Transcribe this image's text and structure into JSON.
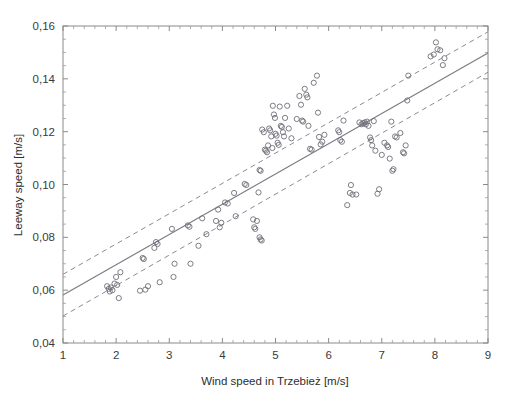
{
  "chart_data": {
    "type": "scatter",
    "title": "",
    "xlabel": "Wind speed in Trzebież [m/s]",
    "ylabel": "Leeway speed [m/s]",
    "xlim": [
      1,
      9
    ],
    "ylim": [
      0.04,
      0.16
    ],
    "xticks": [
      1,
      2,
      3,
      4,
      5,
      6,
      7,
      8,
      9
    ],
    "yticks": [
      0.04,
      0.06,
      0.08,
      0.1,
      0.12,
      0.14,
      0.16
    ],
    "xtick_labels": [
      "1",
      "2",
      "3",
      "4",
      "5",
      "6",
      "7",
      "8",
      "9"
    ],
    "ytick_labels": [
      "0,04",
      "0,06",
      "0,08",
      "0,10",
      "0,12",
      "0,14",
      "0,16"
    ],
    "x_minor_step": 0.2,
    "y_minor_step": 0.005,
    "grid": false,
    "legend": null,
    "marker": "open-circle",
    "marker_color": "#6e6e78",
    "series": [
      {
        "name": "Measurements",
        "points": [
          [
            1.83,
            0.0615
          ],
          [
            1.86,
            0.0605
          ],
          [
            1.88,
            0.0595
          ],
          [
            1.9,
            0.061
          ],
          [
            1.93,
            0.06
          ],
          [
            1.97,
            0.0625
          ],
          [
            2.0,
            0.065
          ],
          [
            2.02,
            0.062
          ],
          [
            2.05,
            0.057
          ],
          [
            2.08,
            0.0668
          ],
          [
            2.45,
            0.0598
          ],
          [
            2.5,
            0.0722
          ],
          [
            2.52,
            0.0718
          ],
          [
            2.55,
            0.0602
          ],
          [
            2.6,
            0.0615
          ],
          [
            2.72,
            0.076
          ],
          [
            2.75,
            0.0782
          ],
          [
            2.78,
            0.0775
          ],
          [
            2.82,
            0.063
          ],
          [
            3.05,
            0.0832
          ],
          [
            3.08,
            0.065
          ],
          [
            3.1,
            0.07
          ],
          [
            3.35,
            0.0845
          ],
          [
            3.38,
            0.084
          ],
          [
            3.4,
            0.07
          ],
          [
            3.55,
            0.0768
          ],
          [
            3.62,
            0.0872
          ],
          [
            3.7,
            0.0812
          ],
          [
            3.88,
            0.0862
          ],
          [
            3.92,
            0.0905
          ],
          [
            3.95,
            0.0838
          ],
          [
            3.98,
            0.0855
          ],
          [
            4.05,
            0.0932
          ],
          [
            4.1,
            0.0928
          ],
          [
            4.22,
            0.0968
          ],
          [
            4.25,
            0.088
          ],
          [
            4.42,
            0.1002
          ],
          [
            4.45,
            0.0998
          ],
          [
            4.58,
            0.0868
          ],
          [
            4.6,
            0.0838
          ],
          [
            4.62,
            0.0832
          ],
          [
            4.65,
            0.0862
          ],
          [
            4.68,
            0.097
          ],
          [
            4.7,
            0.08
          ],
          [
            4.72,
            0.0792
          ],
          [
            4.74,
            0.0788
          ],
          [
            4.7,
            0.1055
          ],
          [
            4.72,
            0.1052
          ],
          [
            4.75,
            0.1208
          ],
          [
            4.78,
            0.1198
          ],
          [
            4.8,
            0.1132
          ],
          [
            4.82,
            0.1128
          ],
          [
            4.84,
            0.1122
          ],
          [
            4.86,
            0.1148
          ],
          [
            4.88,
            0.1212
          ],
          [
            4.9,
            0.1205
          ],
          [
            4.92,
            0.1182
          ],
          [
            4.94,
            0.1138
          ],
          [
            4.95,
            0.1298
          ],
          [
            4.97,
            0.1265
          ],
          [
            4.99,
            0.1252
          ],
          [
            5.0,
            0.1192
          ],
          [
            5.02,
            0.1185
          ],
          [
            5.04,
            0.1158
          ],
          [
            5.06,
            0.115
          ],
          [
            5.08,
            0.1295
          ],
          [
            5.1,
            0.1222
          ],
          [
            5.12,
            0.1218
          ],
          [
            5.14,
            0.1198
          ],
          [
            5.16,
            0.1182
          ],
          [
            5.18,
            0.1252
          ],
          [
            5.22,
            0.1298
          ],
          [
            5.25,
            0.1212
          ],
          [
            5.3,
            0.1175
          ],
          [
            5.4,
            0.1248
          ],
          [
            5.45,
            0.1335
          ],
          [
            5.48,
            0.1302
          ],
          [
            5.5,
            0.1242
          ],
          [
            5.52,
            0.1238
          ],
          [
            5.55,
            0.1362
          ],
          [
            5.58,
            0.134
          ],
          [
            5.6,
            0.133
          ],
          [
            5.62,
            0.1222
          ],
          [
            5.65,
            0.1135
          ],
          [
            5.68,
            0.1132
          ],
          [
            5.72,
            0.1385
          ],
          [
            5.78,
            0.1412
          ],
          [
            5.8,
            0.1272
          ],
          [
            5.82,
            0.118
          ],
          [
            5.85,
            0.1152
          ],
          [
            5.88,
            0.1162
          ],
          [
            5.92,
            0.1188
          ],
          [
            6.18,
            0.1205
          ],
          [
            6.2,
            0.1198
          ],
          [
            6.22,
            0.1168
          ],
          [
            6.25,
            0.1162
          ],
          [
            6.28,
            0.1242
          ],
          [
            6.35,
            0.0922
          ],
          [
            6.4,
            0.0968
          ],
          [
            6.42,
            0.0998
          ],
          [
            6.45,
            0.0962
          ],
          [
            6.52,
            0.0962
          ],
          [
            6.58,
            0.1235
          ],
          [
            6.62,
            0.1228
          ],
          [
            6.65,
            0.1232
          ],
          [
            6.68,
            0.1235
          ],
          [
            6.7,
            0.1228
          ],
          [
            6.72,
            0.1238
          ],
          [
            6.75,
            0.1222
          ],
          [
            6.78,
            0.1178
          ],
          [
            6.8,
            0.1168
          ],
          [
            6.82,
            0.1148
          ],
          [
            6.85,
            0.124
          ],
          [
            6.88,
            0.1128
          ],
          [
            6.92,
            0.0965
          ],
          [
            6.95,
            0.0982
          ],
          [
            7.0,
            0.1112
          ],
          [
            7.05,
            0.1158
          ],
          [
            7.1,
            0.1148
          ],
          [
            7.12,
            0.1142
          ],
          [
            7.15,
            0.1098
          ],
          [
            7.18,
            0.1238
          ],
          [
            7.2,
            0.1052
          ],
          [
            7.22,
            0.1058
          ],
          [
            7.25,
            0.1182
          ],
          [
            7.28,
            0.1178
          ],
          [
            7.35,
            0.1195
          ],
          [
            7.4,
            0.1122
          ],
          [
            7.42,
            0.1118
          ],
          [
            7.45,
            0.1148
          ],
          [
            7.48,
            0.1318
          ],
          [
            7.5,
            0.1412
          ],
          [
            7.92,
            0.1485
          ],
          [
            7.98,
            0.1492
          ],
          [
            8.02,
            0.1538
          ],
          [
            8.05,
            0.1512
          ],
          [
            8.1,
            0.1508
          ],
          [
            8.15,
            0.1452
          ],
          [
            8.18,
            0.1478
          ]
        ]
      }
    ],
    "fit_line": {
      "name": "Linear regression",
      "style": "solid",
      "endpoints": [
        [
          1,
          0.0582
        ],
        [
          9,
          0.1498
        ]
      ]
    },
    "confidence_bands": [
      {
        "name": "Upper confidence limit",
        "style": "dashed",
        "endpoints": [
          [
            1,
            0.066
          ],
          [
            9,
            0.1578
          ]
        ]
      },
      {
        "name": "Lower confidence limit",
        "style": "dashed",
        "endpoints": [
          [
            1,
            0.0502
          ],
          [
            9,
            0.1425
          ]
        ]
      }
    ]
  }
}
